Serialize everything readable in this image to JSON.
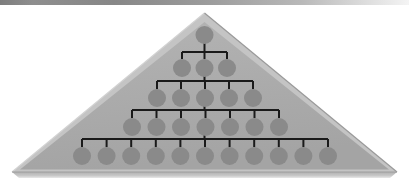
{
  "diagram": {
    "type": "pyramid-org-chart",
    "node_shape": "circle",
    "node_count_total": 27,
    "levels": 5
  },
  "canvas": {
    "width": 409,
    "height": 183,
    "background": "#ffffff"
  },
  "top_bar": {
    "label": "top-divider-bar",
    "x": 0,
    "y": 0,
    "width": 409,
    "height": 5,
    "color_left": "#7d7d7d",
    "color_mid": "#969696",
    "color_right": "#f2f2f2"
  },
  "triangle": {
    "label": "pyramid-body",
    "apex_x": 204.5,
    "apex_y": 13,
    "left_x": 12,
    "left_y": 172,
    "right_x": 397,
    "right_y": 172,
    "fill": "#ababab",
    "edge_light": "#c9c9c9",
    "edge_dark": "#8f8f8f",
    "bevel_width": 7,
    "base_shadow": "#bdbdbd",
    "base_shadow_height": 6
  },
  "node_style": {
    "fill": "#8a8a8a",
    "stroke": "none",
    "radius": 9
  },
  "connector_style": {
    "color": "#1a1a1a",
    "width": 2
  },
  "levels": [
    {
      "level": 1,
      "label": "level-1-root",
      "y": 35,
      "node_count": 1,
      "nodes": [
        {
          "id": "n1",
          "x": 204.5
        }
      ],
      "bus_y": null,
      "bus_x1": null,
      "bus_x2": null
    },
    {
      "level": 2,
      "label": "level-2",
      "y": 68,
      "node_count": 3,
      "nodes": [
        {
          "id": "n2",
          "x": 182
        },
        {
          "id": "n3",
          "x": 204.5
        },
        {
          "id": "n4",
          "x": 227
        }
      ],
      "bus_y": 52,
      "bus_x1": 182,
      "bus_x2": 227,
      "parent_x": 204.5,
      "parent_y": 35
    },
    {
      "level": 3,
      "label": "level-3",
      "y": 98,
      "node_count": 5,
      "nodes": [
        {
          "id": "n5",
          "x": 157
        },
        {
          "id": "n6",
          "x": 181
        },
        {
          "id": "n7",
          "x": 205
        },
        {
          "id": "n8",
          "x": 229
        },
        {
          "id": "n9",
          "x": 253
        }
      ],
      "bus_y": 81,
      "bus_x1": 157,
      "bus_x2": 253,
      "parent_x": 204.5,
      "parent_y": 68
    },
    {
      "level": 4,
      "label": "level-4",
      "y": 127,
      "node_count": 7,
      "nodes": [
        {
          "id": "n10",
          "x": 132
        },
        {
          "id": "n11",
          "x": 156.5
        },
        {
          "id": "n12",
          "x": 181
        },
        {
          "id": "n13",
          "x": 205.5
        },
        {
          "id": "n14",
          "x": 230
        },
        {
          "id": "n15",
          "x": 254.5
        },
        {
          "id": "n16",
          "x": 279
        }
      ],
      "bus_y": 110,
      "bus_x1": 132,
      "bus_x2": 279,
      "parent_x": 204.5,
      "parent_y": 98
    },
    {
      "level": 5,
      "label": "level-5",
      "y": 156,
      "node_count": 11,
      "nodes": [
        {
          "id": "n17",
          "x": 82
        },
        {
          "id": "n18",
          "x": 106.6
        },
        {
          "id": "n19",
          "x": 131.2
        },
        {
          "id": "n20",
          "x": 155.8
        },
        {
          "id": "n21",
          "x": 180.4
        },
        {
          "id": "n22",
          "x": 205
        },
        {
          "id": "n23",
          "x": 229.6
        },
        {
          "id": "n24",
          "x": 254.2
        },
        {
          "id": "n25",
          "x": 278.8
        },
        {
          "id": "n26",
          "x": 303.4
        },
        {
          "id": "n27",
          "x": 328
        }
      ],
      "bus_y": 139,
      "bus_x1": 82,
      "bus_x2": 328,
      "parent_x": 204.5,
      "parent_y": 127
    }
  ]
}
